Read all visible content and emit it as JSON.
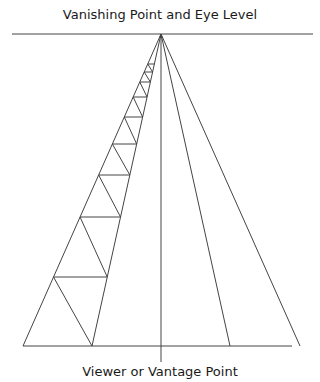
{
  "diagram": {
    "title_top": "Vanishing Point and Eye Level",
    "title_bottom": "Viewer or Vantage Point",
    "colors": {
      "line": "#444444",
      "text": "#1a1a1a",
      "background": "#ffffff"
    },
    "horizon": {
      "y": 34,
      "x1": 12,
      "x2": 313
    },
    "vanishing_point": {
      "x": 161,
      "y": 34
    },
    "baseline": {
      "y": 346,
      "x1": 23,
      "x2": 292
    },
    "center_line": {
      "x": 161,
      "y1": 34,
      "y2": 362
    },
    "rays_bottom_x": [
      23,
      92,
      161,
      230,
      300
    ],
    "rung_ys": [
      346,
      277,
      217,
      175,
      144,
      117,
      97,
      82,
      72,
      64
    ]
  }
}
